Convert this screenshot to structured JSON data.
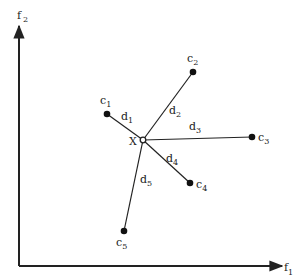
{
  "axes": {
    "x_label": "f",
    "x_label_sub": "1",
    "y_label": "f",
    "y_label_sub": "2",
    "origin": [
      19,
      266
    ],
    "x_end": [
      284,
      266
    ],
    "y_end": [
      19,
      24
    ]
  },
  "query_point": {
    "label": "X",
    "pos": [
      143,
      140
    ]
  },
  "clusters": [
    {
      "label": "c",
      "sub": "1",
      "pos": [
        107,
        114
      ],
      "dist_label": "d",
      "dist_sub": "1"
    },
    {
      "label": "c",
      "sub": "2",
      "pos": [
        193,
        72
      ],
      "dist_label": "d",
      "dist_sub": "2"
    },
    {
      "label": "c",
      "sub": "3",
      "pos": [
        252,
        137
      ],
      "dist_label": "d",
      "dist_sub": "3"
    },
    {
      "label": "c",
      "sub": "4",
      "pos": [
        190,
        183
      ],
      "dist_label": "d",
      "dist_sub": "4"
    },
    {
      "label": "c",
      "sub": "5",
      "pos": [
        124,
        231
      ],
      "dist_label": "d",
      "dist_sub": "5"
    }
  ],
  "colors": {
    "ink": "#222222",
    "background": "#ffffff"
  }
}
